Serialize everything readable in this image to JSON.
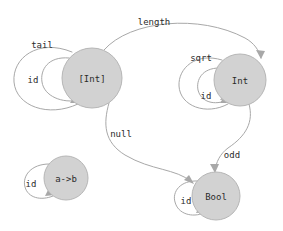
{
  "diagram": {
    "type": "state-transition-graph",
    "background_color": "#ffffff",
    "node_fill_color": "#d2d2d2",
    "node_stroke_color": "#b6b6b6",
    "edge_color": "#a8a8a8",
    "text_color": "#2b2b2b",
    "nodes": [
      {
        "id": "list-int",
        "label": "[Int]",
        "cx": 92,
        "cy": 78,
        "r": 30
      },
      {
        "id": "int",
        "label": "Int",
        "cx": 240,
        "cy": 80,
        "r": 26
      },
      {
        "id": "bool",
        "label": "Bool",
        "cx": 216,
        "cy": 196,
        "r": 24
      },
      {
        "id": "a-to-b",
        "label": "a->b",
        "cx": 66,
        "cy": 178,
        "r": 22
      }
    ],
    "edges": [
      {
        "id": "length",
        "label": "length",
        "from": "list-int",
        "to": "int",
        "label_x": 154,
        "label_y": 22
      },
      {
        "id": "null",
        "label": "null",
        "from": "list-int",
        "to": "bool",
        "label_x": 121,
        "label_y": 134
      },
      {
        "id": "odd",
        "label": "odd",
        "from": "int",
        "to": "bool",
        "label_x": 232,
        "label_y": 155
      }
    ],
    "self_loops": [
      {
        "id": "tail",
        "label": "tail",
        "node": "list-int",
        "label_x": 42,
        "label_y": 45
      },
      {
        "id": "id-list-int",
        "label": "id",
        "node": "list-int",
        "label_x": 33,
        "label_y": 80
      },
      {
        "id": "sqrt",
        "label": "sqrt",
        "node": "int",
        "label_x": 201,
        "label_y": 58
      },
      {
        "id": "id-int",
        "label": "id",
        "node": "int",
        "label_x": 206,
        "label_y": 96
      },
      {
        "id": "id-bool",
        "label": "id",
        "node": "bool",
        "label_x": 186,
        "label_y": 201
      },
      {
        "id": "id-a-to-b",
        "label": "id",
        "node": "a-to-b",
        "label_x": 31,
        "label_y": 184
      }
    ]
  }
}
